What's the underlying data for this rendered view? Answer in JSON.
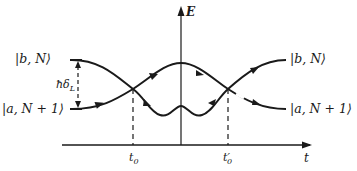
{
  "diagram": {
    "axes": {
      "y_label": "E",
      "x_label": "t"
    },
    "states": {
      "left_upper": "|b, N⟩",
      "left_lower": "|a, N + 1⟩",
      "right_upper": "|b, N⟩",
      "right_lower": "|a, N + 1⟩"
    },
    "gap_label": "ħδ",
    "gap_subscript": "L",
    "time_marks": {
      "t0": "t",
      "t0_sub": "0",
      "t0_prime": "t′",
      "t0_prime_sub": "0"
    },
    "colors": {
      "line": "#1a1a1a",
      "background": "#ffffff"
    }
  }
}
